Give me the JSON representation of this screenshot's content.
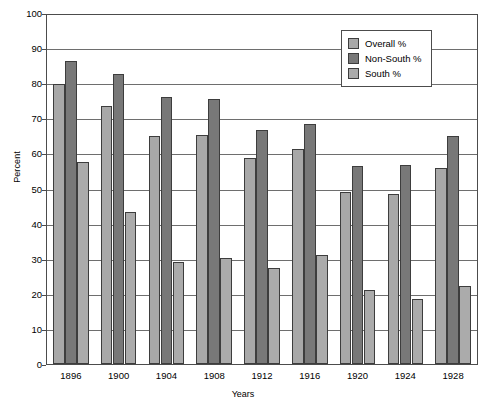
{
  "chart_data": {
    "type": "bar",
    "title": "",
    "xlabel": "Years",
    "ylabel": "Percent",
    "ylim": [
      0,
      100
    ],
    "yticks": [
      0,
      10,
      20,
      30,
      40,
      50,
      60,
      70,
      80,
      90,
      100
    ],
    "grid": true,
    "legend_position": "upper right (inside plot area)",
    "categories": [
      "1896",
      "1900",
      "1904",
      "1908",
      "1912",
      "1916",
      "1920",
      "1924",
      "1928"
    ],
    "series": [
      {
        "name": "Overall %",
        "color": "#a8a8a8",
        "values": [
          79.8,
          73.5,
          65.0,
          65.2,
          58.8,
          61.3,
          48.9,
          48.4,
          55.8
        ]
      },
      {
        "name": "Non-South %",
        "color": "#787878",
        "values": [
          86.2,
          82.6,
          76.2,
          75.5,
          66.7,
          68.5,
          56.5,
          56.8,
          65.1
        ]
      },
      {
        "name": "South %",
        "color": "#ababab",
        "values": [
          57.5,
          43.2,
          29.0,
          30.3,
          27.3,
          31.2,
          21.2,
          18.4,
          22.2
        ]
      }
    ]
  },
  "legend": {
    "items": [
      {
        "label": "Overall %",
        "color": "#a8a8a8"
      },
      {
        "label": "Non-South %",
        "color": "#787878"
      },
      {
        "label": "South %",
        "color": "#ababab"
      }
    ]
  },
  "axes": {
    "y_title": "Percent",
    "x_title": "Years"
  }
}
